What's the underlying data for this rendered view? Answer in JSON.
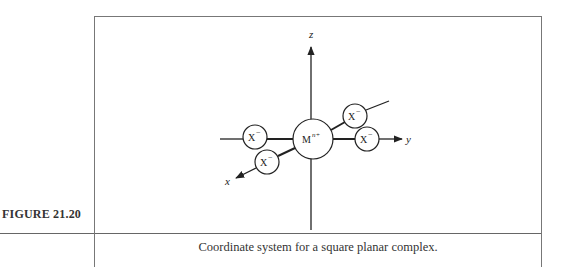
{
  "figure": {
    "label": "FIGURE 21.20",
    "caption": "Coordinate system for a square planar complex."
  },
  "diagram": {
    "axes": {
      "z": "z",
      "y": "y",
      "x": "x"
    },
    "center_atom": {
      "symbol": "M",
      "superscript": "n+"
    },
    "ligands": [
      {
        "position": "-y",
        "symbol": "X",
        "charge": "−"
      },
      {
        "position": "+x",
        "symbol": "X",
        "charge": "−"
      },
      {
        "position": "-x",
        "symbol": "X",
        "charge": "−"
      },
      {
        "position": "+y",
        "symbol": "X",
        "charge": "−"
      }
    ],
    "colors": {
      "stroke": "#222222",
      "frame": "#777777"
    }
  }
}
